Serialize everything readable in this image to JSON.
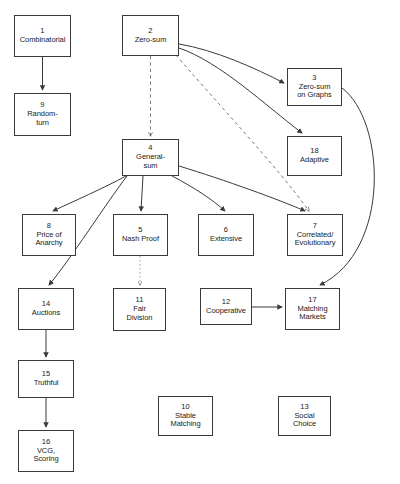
{
  "diagram": {
    "background_color": "#ffffff",
    "stroke_color": "#3a3a3a",
    "text_color": "#1a1a1a",
    "nodes": [
      {
        "id": "1",
        "label": "Combinatorial",
        "x": 14,
        "y": 15,
        "w": 57,
        "h": 42
      },
      {
        "id": "2",
        "label": "Zero-sum",
        "x": 122,
        "y": 15,
        "w": 57,
        "h": 41
      },
      {
        "id": "3",
        "label": "Zero-sum\non Graphs",
        "x": 287,
        "y": 68,
        "w": 55,
        "h": 38
      },
      {
        "id": "4",
        "label": "General-\nsum",
        "x": 122,
        "y": 139,
        "w": 57,
        "h": 37
      },
      {
        "id": "5",
        "label": "Nash Proof",
        "x": 113,
        "y": 214,
        "w": 55,
        "h": 42
      },
      {
        "id": "6",
        "label": "Extensive",
        "x": 198,
        "y": 214,
        "w": 56,
        "h": 42
      },
      {
        "id": "7",
        "label": "Correlated/\nEvolutionary",
        "x": 287,
        "y": 214,
        "w": 56,
        "h": 42
      },
      {
        "id": "8",
        "label": "Price of\nAnarchy",
        "x": 22,
        "y": 214,
        "w": 54,
        "h": 42
      },
      {
        "id": "9",
        "label": "Random-\nturn",
        "x": 14,
        "y": 93,
        "w": 57,
        "h": 43
      },
      {
        "id": "10",
        "label": "Stable\nMatching",
        "x": 158,
        "y": 396,
        "w": 55,
        "h": 40
      },
      {
        "id": "11",
        "label": "Fair\nDivision",
        "x": 113,
        "y": 288,
        "w": 53,
        "h": 43
      },
      {
        "id": "12",
        "label": "Cooperative",
        "x": 200,
        "y": 288,
        "w": 52,
        "h": 37
      },
      {
        "id": "13",
        "label": "Social\nChoice",
        "x": 278,
        "y": 396,
        "w": 53,
        "h": 40
      },
      {
        "id": "14",
        "label": "Auctions",
        "x": 18,
        "y": 288,
        "w": 56,
        "h": 42
      },
      {
        "id": "15",
        "label": "Truthful",
        "x": 18,
        "y": 360,
        "w": 56,
        "h": 38
      },
      {
        "id": "16",
        "label": "VCG,\nScoring",
        "x": 18,
        "y": 430,
        "w": 56,
        "h": 42
      },
      {
        "id": "17",
        "label": "Matching\nMarkets",
        "x": 285,
        "y": 288,
        "w": 55,
        "h": 42
      },
      {
        "id": "18",
        "label": "Adaptive",
        "x": 287,
        "y": 136,
        "w": 55,
        "h": 40
      }
    ],
    "edges": [
      {
        "from": "1",
        "to": "9",
        "style": "solid",
        "path": "M 42.5 57 L 42.5 90"
      },
      {
        "from": "2",
        "to": "4",
        "style": "dashed",
        "path": "M 150.5 56 L 150.5 136"
      },
      {
        "from": "2",
        "to": "3",
        "style": "solid",
        "path": "M 179 44 C 215 50 255 68 284 83"
      },
      {
        "from": "2",
        "to": "18",
        "style": "solid",
        "path": "M 179 48 C 220 62 265 105 302 133"
      },
      {
        "from": "2",
        "to": "7",
        "style": "dashed",
        "path": "M 176 55 C 210 95 280 170 309 211"
      },
      {
        "from": "3",
        "to": "17",
        "style": "solid",
        "path": "M 342 88 C 385 120 392 250 320 285"
      },
      {
        "from": "4",
        "to": "8",
        "style": "solid",
        "path": "M 126 176 C 104 188 72 202 53 211"
      },
      {
        "from": "4",
        "to": "14",
        "style": "solid",
        "path": "M 127 176 C 105 205 70 260 49 285"
      },
      {
        "from": "4",
        "to": "5",
        "style": "solid",
        "path": "M 143 176 L 141 211"
      },
      {
        "from": "4",
        "to": "6",
        "style": "solid",
        "path": "M 172 176 C 195 188 213 200 225 211"
      },
      {
        "from": "4",
        "to": "7",
        "style": "solid",
        "path": "M 179 166 C 225 180 280 200 305 211"
      },
      {
        "from": "5",
        "to": "11",
        "style": "dotted",
        "path": "M 140 256 L 140 285"
      },
      {
        "from": "12",
        "to": "17",
        "style": "solid",
        "path": "M 252 307 L 282 307"
      },
      {
        "from": "14",
        "to": "15",
        "style": "solid",
        "path": "M 46 330 L 46 357"
      },
      {
        "from": "15",
        "to": "16",
        "style": "solid",
        "path": "M 46 398 L 46 427"
      }
    ]
  }
}
